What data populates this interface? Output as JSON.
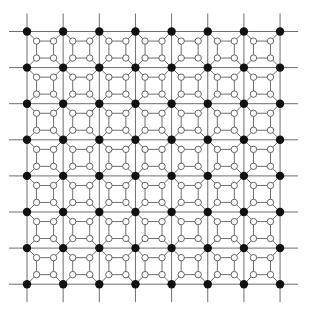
{
  "diagram": {
    "grid": {
      "rows": 8,
      "cols": 8,
      "origin_x": 27,
      "origin_y": 31.5,
      "step_x": 36.15,
      "step_y": 36.1,
      "line_overhang": 18
    },
    "inner": {
      "inset_ratio": 0.265
    },
    "style": {
      "line_color": "#6e6e6e",
      "line_width": 1,
      "black_node_color": "#111111",
      "black_node_radius": 4.2,
      "hollow_node_fill": "#ffffff",
      "hollow_node_stroke": "#555555",
      "hollow_node_radius": 3.2,
      "hollow_stroke_width": 0.9,
      "background": "#ffffff"
    }
  }
}
